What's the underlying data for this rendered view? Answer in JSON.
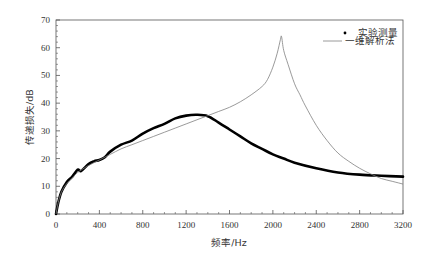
{
  "chart_data": {
    "type": "line",
    "title": "",
    "xlabel": "频率/Hz",
    "ylabel": "传递损失/dB",
    "xlim": [
      0,
      3200
    ],
    "ylim": [
      0,
      70
    ],
    "xticks": [
      0,
      400,
      800,
      1200,
      1600,
      2000,
      2400,
      2800,
      3200
    ],
    "yticks": [
      0,
      10,
      20,
      30,
      40,
      50,
      60,
      70
    ],
    "grid": false,
    "legend_position": "upper right",
    "series": [
      {
        "name": "实验测量",
        "style": "dots",
        "color": "#000000",
        "x": [
          0,
          20,
          50,
          100,
          150,
          200,
          230,
          300,
          350,
          400,
          450,
          500,
          600,
          700,
          800,
          900,
          1000,
          1100,
          1200,
          1300,
          1400,
          1500,
          1600,
          1700,
          1800,
          1900,
          2000,
          2100,
          2200,
          2400,
          2600,
          2800,
          3000,
          3200
        ],
        "y": [
          0,
          4,
          8,
          11.5,
          13.5,
          16,
          15.5,
          18,
          19,
          19.5,
          20.5,
          22.5,
          25,
          26.5,
          29,
          31,
          32.5,
          34.5,
          35.5,
          35.8,
          35.3,
          33,
          30.5,
          28,
          25.5,
          23.5,
          21.5,
          20,
          18.5,
          16.5,
          15,
          14.2,
          13.8,
          13.5
        ]
      },
      {
        "name": "一维解析法",
        "style": "line",
        "color": "#808080",
        "x": [
          0,
          20,
          50,
          100,
          150,
          200,
          300,
          400,
          500,
          600,
          700,
          800,
          900,
          1000,
          1100,
          1200,
          1300,
          1400,
          1500,
          1600,
          1700,
          1800,
          1900,
          1950,
          2000,
          2040,
          2070,
          2080,
          2100,
          2140,
          2200,
          2250,
          2300,
          2400,
          2500,
          2600,
          2700,
          2800,
          2900,
          3000,
          3100,
          3200
        ],
        "y": [
          0,
          4,
          8,
          11,
          13,
          15,
          17.5,
          19.5,
          21.5,
          23.5,
          25,
          26.5,
          28,
          29.5,
          31,
          32.5,
          34,
          35.5,
          37,
          38.5,
          40.5,
          43,
          46,
          48.5,
          53,
          58,
          63,
          64,
          59,
          54,
          47,
          43,
          39,
          32,
          26.5,
          22,
          19,
          16.5,
          14.5,
          12.8,
          11.8,
          10.8
        ]
      }
    ]
  },
  "legend": {
    "items": [
      {
        "label": "实验测量",
        "marker": "dot"
      },
      {
        "label": "一维解析法",
        "marker": "line"
      }
    ]
  },
  "axes": {
    "x_label": "频率/Hz",
    "y_label": "传递损失/dB"
  },
  "colors": {
    "axis": "#555555",
    "measured": "#000000",
    "analytical": "#808080"
  }
}
